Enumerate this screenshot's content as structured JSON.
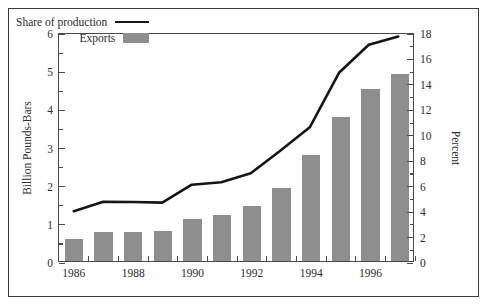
{
  "chart_data": {
    "type": "bar",
    "title": "",
    "xlabel": "",
    "ylabel": "Billion Pounds-Bars",
    "y2label": "Percent",
    "categories": [
      "1986",
      "1987",
      "1988",
      "1989",
      "1990",
      "1991",
      "1992",
      "1993",
      "1994",
      "1995",
      "1996",
      "1997"
    ],
    "x_tick_labels": [
      "1986",
      "1988",
      "1990",
      "1992",
      "1994",
      "1996"
    ],
    "ylim": [
      0,
      6
    ],
    "y2lim": [
      0,
      18
    ],
    "y_ticks": [
      0,
      1,
      2,
      3,
      4,
      5,
      6
    ],
    "y_minor_ticks": [
      0.5,
      1.5,
      2.5,
      3.5,
      4.5,
      5.5
    ],
    "y2_ticks": [
      0,
      2,
      4,
      6,
      8,
      10,
      12,
      14,
      16,
      18
    ],
    "y2_minor_ticks": [
      1,
      3,
      5,
      7,
      9,
      11,
      13,
      15,
      17
    ],
    "grid": false,
    "legend_position": "upper left",
    "series": [
      {
        "name": "Exports",
        "type": "bar",
        "axis": "left",
        "unit": "Billion Pounds",
        "color": "#8e8e8e",
        "values": [
          0.57,
          0.75,
          0.76,
          0.79,
          1.09,
          1.21,
          1.44,
          1.9,
          2.79,
          3.77,
          4.52,
          4.91
        ]
      },
      {
        "name": "Share of production",
        "type": "line",
        "axis": "right",
        "unit": "Percent",
        "color": "#151515",
        "values": [
          3.95,
          4.7,
          4.68,
          4.63,
          6.05,
          6.25,
          6.95,
          8.75,
          10.6,
          14.95,
          17.15,
          17.8
        ]
      }
    ]
  },
  "legend": {
    "items": [
      {
        "label": "Share of production",
        "marker": "line",
        "color": "#151515"
      },
      {
        "label": "Exports",
        "marker": "bar",
        "color": "#8e8e8e"
      }
    ]
  },
  "axes": {
    "left_title": "Billion Pounds-Bars",
    "right_title": "Percent"
  },
  "colors": {
    "bar": "#8e8e8e",
    "line": "#151515",
    "axis": "#4a4a4a",
    "frame": "#3a3a3a",
    "text": "#2c2c2c",
    "background": "#ffffff"
  }
}
